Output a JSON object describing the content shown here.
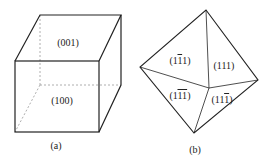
{
  "figure_a": {
    "caption": "(a)",
    "faces": {
      "top": "(001)",
      "front": "(100)"
    }
  },
  "figure_b": {
    "caption": "(b)",
    "faces": [
      {
        "pre": "(1",
        "bar": "1",
        "post": "1)"
      },
      {
        "pre": "(111)",
        "bar": "",
        "post": ""
      },
      {
        "pre": "(1",
        "bar": "11",
        "post": ")"
      },
      {
        "pre": "(11",
        "bar": "1",
        "post": ")"
      }
    ]
  }
}
